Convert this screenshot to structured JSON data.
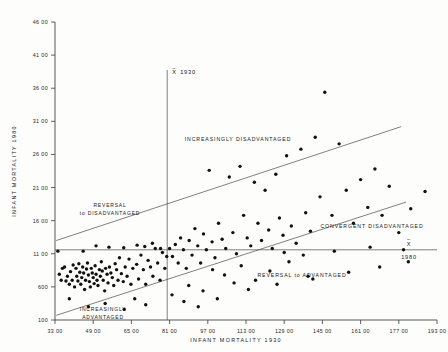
{
  "figure": {
    "background_color": "#fdfdfc",
    "ink_color": "#171717"
  },
  "axes": {
    "x_title": "INFANT  MORTALITY  1930",
    "y_title": "INFANT   MORTALITY   1980",
    "x_ticks": [
      "3300",
      "4900",
      "6500",
      "8100",
      "9700",
      "11300",
      "12900",
      "14500",
      "16100",
      "17700",
      "19300"
    ],
    "y_ticks": [
      "4600",
      "4100",
      "3600",
      "3100",
      "2600",
      "2100",
      "1600",
      "1100",
      "600",
      "100"
    ],
    "xlim": [
      3300,
      19300
    ],
    "ylim": [
      100,
      4600
    ]
  },
  "reference_lines": {
    "vertical_mean_label_top": "X",
    "vertical_mean_label_year": "1930",
    "horizontal_mean_label_top": "X",
    "horizontal_mean_label_year": "1980"
  },
  "annotations": {
    "increasingly_disadvantaged": "INCREASINGLY  DISADVANTAGED",
    "reversal_to_disadvantaged_line1": "REVERSAL",
    "reversal_to_disadvantaged_line2": "to  DISADVANTAGED",
    "convergent_disadvantaged": "CONVERGENT  DISADVANTAGED",
    "reversal_to_advantaged": "REVERSAL  to  ADVANTAGED",
    "increasingly_advantaged_line1": "INCREASINGLY",
    "increasingly_advantaged_line2": "ADVANTAGED"
  },
  "chart_data": {
    "type": "scatter",
    "title": "",
    "xlabel": "INFANT  MORTALITY  1930",
    "ylabel": "INFANT   MORTALITY   1980",
    "xlim": [
      3300,
      19300
    ],
    "ylim": [
      100,
      4600
    ],
    "grid": false,
    "legend": "none",
    "xticks": [
      3300,
      4900,
      6500,
      8100,
      9700,
      11300,
      12900,
      14500,
      16100,
      17700,
      19300
    ],
    "yticks": [
      100,
      600,
      1100,
      1600,
      2100,
      2600,
      3100,
      3600,
      4100,
      4600
    ],
    "reference_lines": [
      {
        "name": "mean-1930-vertical",
        "orientation": "vertical",
        "x": 8000,
        "label": "X̄ 1930"
      },
      {
        "name": "mean-1980-horizontal",
        "orientation": "horizontal",
        "y": 1160,
        "label": "X̄ 1980"
      },
      {
        "name": "upper-boundary",
        "orientation": "diagonal",
        "x0": 3350,
        "y0": 1300,
        "x1": 17800,
        "y1": 3020
      },
      {
        "name": "lower-boundary",
        "orientation": "diagonal",
        "x0": 3350,
        "y0": 170,
        "x1": 18000,
        "y1": 1880
      }
    ],
    "points": [
      [
        3420,
        1140
      ],
      [
        3480,
        790
      ],
      [
        3560,
        700
      ],
      [
        3610,
        880
      ],
      [
        3700,
        900
      ],
      [
        3760,
        690
      ],
      [
        3820,
        760
      ],
      [
        3900,
        640
      ],
      [
        3950,
        830
      ],
      [
        4020,
        700
      ],
      [
        4060,
        930
      ],
      [
        4120,
        600
      ],
      [
        4180,
        880
      ],
      [
        4210,
        760
      ],
      [
        4260,
        690
      ],
      [
        4300,
        950
      ],
      [
        4340,
        820
      ],
      [
        4380,
        640
      ],
      [
        4420,
        740
      ],
      [
        4460,
        900
      ],
      [
        4500,
        810
      ],
      [
        4540,
        560
      ],
      [
        4580,
        700
      ],
      [
        4620,
        870
      ],
      [
        4660,
        960
      ],
      [
        4700,
        780
      ],
      [
        4740,
        680
      ],
      [
        4780,
        600
      ],
      [
        4820,
        880
      ],
      [
        4860,
        810
      ],
      [
        4900,
        740
      ],
      [
        4940,
        650
      ],
      [
        4980,
        920
      ],
      [
        5020,
        790
      ],
      [
        5060,
        700
      ],
      [
        5100,
        620
      ],
      [
        5160,
        860
      ],
      [
        5200,
        760
      ],
      [
        5240,
        980
      ],
      [
        5280,
        840
      ],
      [
        5320,
        700
      ],
      [
        5380,
        540
      ],
      [
        5420,
        880
      ],
      [
        5480,
        790
      ],
      [
        5520,
        660
      ],
      [
        5580,
        900
      ],
      [
        5640,
        810
      ],
      [
        5700,
        740
      ],
      [
        5760,
        620
      ],
      [
        5820,
        950
      ],
      [
        5880,
        860
      ],
      [
        5940,
        700
      ],
      [
        6000,
        1040
      ],
      [
        6080,
        800
      ],
      [
        6160,
        680
      ],
      [
        6240,
        900
      ],
      [
        6320,
        760
      ],
      [
        6400,
        1020
      ],
      [
        6480,
        640
      ],
      [
        6560,
        880
      ],
      [
        6640,
        420
      ],
      [
        6720,
        940
      ],
      [
        6800,
        720
      ],
      [
        6900,
        1080
      ],
      [
        7000,
        860
      ],
      [
        7100,
        640
      ],
      [
        7200,
        1000
      ],
      [
        7300,
        900
      ],
      [
        7400,
        760
      ],
      [
        7500,
        1180
      ],
      [
        7600,
        960
      ],
      [
        7700,
        700
      ],
      [
        7800,
        1120
      ],
      [
        7900,
        880
      ],
      [
        7980,
        1060
      ],
      [
        4480,
        1140
      ],
      [
        5020,
        1220
      ],
      [
        5560,
        1200
      ],
      [
        6180,
        1190
      ],
      [
        6740,
        1230
      ],
      [
        7060,
        1210
      ],
      [
        7380,
        1260
      ],
      [
        7720,
        1180
      ],
      [
        8100,
        1180
      ],
      [
        8220,
        1060
      ],
      [
        8340,
        1240
      ],
      [
        8460,
        960
      ],
      [
        8560,
        1340
      ],
      [
        8680,
        1160
      ],
      [
        8800,
        880
      ],
      [
        8920,
        1300
      ],
      [
        9040,
        1080
      ],
      [
        9160,
        1480
      ],
      [
        9280,
        1220
      ],
      [
        9400,
        960
      ],
      [
        9520,
        1400
      ],
      [
        9640,
        1160
      ],
      [
        9760,
        2360
      ],
      [
        9880,
        1280
      ],
      [
        10000,
        1040
      ],
      [
        10150,
        1560
      ],
      [
        10300,
        1320
      ],
      [
        10450,
        1180
      ],
      [
        10600,
        2260
      ],
      [
        10750,
        1420
      ],
      [
        10900,
        1100
      ],
      [
        11050,
        2420
      ],
      [
        11200,
        1680
      ],
      [
        11350,
        1340
      ],
      [
        11500,
        1220
      ],
      [
        11650,
        2180
      ],
      [
        11800,
        1560
      ],
      [
        11950,
        1300
      ],
      [
        12100,
        2060
      ],
      [
        12250,
        1460
      ],
      [
        12400,
        1180
      ],
      [
        12550,
        2300
      ],
      [
        12700,
        1640
      ],
      [
        12850,
        1380
      ],
      [
        13000,
        2580
      ],
      [
        13200,
        1520
      ],
      [
        13400,
        1260
      ],
      [
        13600,
        2680
      ],
      [
        13800,
        1720
      ],
      [
        14000,
        1440
      ],
      [
        14200,
        2860
      ],
      [
        14400,
        1960
      ],
      [
        14600,
        3540
      ],
      [
        14900,
        1680
      ],
      [
        15200,
        2760
      ],
      [
        15500,
        2060
      ],
      [
        15800,
        1560
      ],
      [
        16100,
        2220
      ],
      [
        16400,
        1800
      ],
      [
        16700,
        2380
      ],
      [
        17000,
        1680
      ],
      [
        17300,
        2120
      ],
      [
        17700,
        1420
      ],
      [
        18200,
        1780
      ],
      [
        18800,
        2040
      ],
      [
        12900,
        1120
      ],
      [
        13700,
        1080
      ],
      [
        15000,
        1140
      ],
      [
        16500,
        1200
      ],
      [
        17900,
        1160
      ],
      [
        9900,
        860
      ],
      [
        10400,
        780
      ],
      [
        11100,
        920
      ],
      [
        11700,
        700
      ],
      [
        12300,
        840
      ],
      [
        13100,
        980
      ],
      [
        13900,
        760
      ],
      [
        8900,
        620
      ],
      [
        9500,
        540
      ],
      [
        10800,
        660
      ],
      [
        8200,
        480
      ],
      [
        8700,
        380
      ],
      [
        9300,
        300
      ],
      [
        10100,
        420
      ],
      [
        11400,
        560
      ],
      [
        12600,
        640
      ],
      [
        14100,
        720
      ],
      [
        15600,
        820
      ],
      [
        16900,
        900
      ],
      [
        18100,
        980
      ],
      [
        6200,
        260
      ],
      [
        7100,
        330
      ],
      [
        4700,
        300
      ],
      [
        5400,
        350
      ],
      [
        3900,
        420
      ]
    ]
  }
}
